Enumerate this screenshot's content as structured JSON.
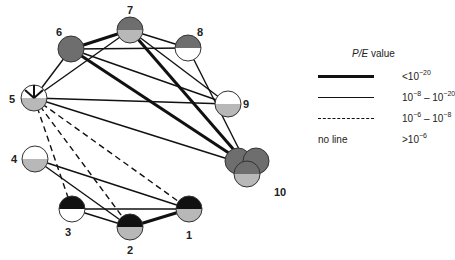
{
  "diagram": {
    "colors": {
      "dark_gray": "#6e6e6e",
      "light_gray": "#b8b8b8",
      "black": "#111111",
      "white": "#ffffff",
      "stroke": "#333333"
    },
    "nodes": [
      {
        "id": "1",
        "label": "1",
        "x": 189,
        "y": 209,
        "top": "black",
        "bottom": "light_gray",
        "label_x": 189,
        "label_y": 239
      },
      {
        "id": "2",
        "label": "2",
        "x": 130,
        "y": 227,
        "top": "black",
        "bottom": "light_gray",
        "label_x": 130,
        "label_y": 254
      },
      {
        "id": "3",
        "label": "3",
        "x": 72,
        "y": 209,
        "top": "black",
        "bottom": "white",
        "label_x": 68,
        "label_y": 236
      },
      {
        "id": "4",
        "label": "4",
        "x": 35,
        "y": 159,
        "top": "white",
        "bottom": "light_gray",
        "label_x": 14,
        "label_y": 163
      },
      {
        "id": "5",
        "label": "5",
        "x": 34,
        "y": 98,
        "top": "white",
        "bottom": "light_gray",
        "label_x": 12,
        "label_y": 103,
        "special": "arrow"
      },
      {
        "id": "6",
        "label": "6",
        "x": 71,
        "y": 49,
        "top": "dark_gray",
        "bottom": "dark_gray",
        "label_x": 59,
        "label_y": 36
      },
      {
        "id": "7",
        "label": "7",
        "x": 130,
        "y": 30,
        "top": "dark_gray",
        "bottom": "light_gray",
        "label_x": 130,
        "label_y": 14
      },
      {
        "id": "8",
        "label": "8",
        "x": 188,
        "y": 48,
        "top": "dark_gray",
        "bottom": "white",
        "label_x": 200,
        "label_y": 36
      },
      {
        "id": "9",
        "label": "9",
        "x": 228,
        "y": 104,
        "top": "white",
        "bottom": "light_gray",
        "label_x": 246,
        "label_y": 108
      },
      {
        "id": "10",
        "label": "10",
        "x": 247,
        "y": 165,
        "cluster": true,
        "label_x": 280,
        "label_y": 196
      }
    ],
    "edges": [
      {
        "from": "6",
        "to": "7",
        "type": "thick"
      },
      {
        "from": "6",
        "to": "10",
        "type": "thick"
      },
      {
        "from": "7",
        "to": "10",
        "type": "thick"
      },
      {
        "from": "2",
        "to": "1",
        "type": "thick"
      },
      {
        "from": "5",
        "to": "6",
        "type": "thin"
      },
      {
        "from": "5",
        "to": "7",
        "type": "thin"
      },
      {
        "from": "6",
        "to": "8",
        "type": "thin"
      },
      {
        "from": "7",
        "to": "8",
        "type": "thin"
      },
      {
        "from": "6",
        "to": "9",
        "type": "thin"
      },
      {
        "from": "7",
        "to": "9",
        "type": "thin"
      },
      {
        "from": "5",
        "to": "9",
        "type": "thin"
      },
      {
        "from": "5",
        "to": "10",
        "type": "thin"
      },
      {
        "from": "8",
        "to": "10",
        "type": "thin"
      },
      {
        "from": "4",
        "to": "1",
        "type": "thin"
      },
      {
        "from": "4",
        "to": "2",
        "type": "thin"
      },
      {
        "from": "3",
        "to": "1",
        "type": "thin"
      },
      {
        "from": "3",
        "to": "2",
        "type": "thin"
      },
      {
        "from": "5",
        "to": "3",
        "type": "dashed"
      },
      {
        "from": "5",
        "to": "2",
        "type": "dashed"
      },
      {
        "from": "5",
        "to": "1",
        "type": "dashed"
      }
    ]
  },
  "legend": {
    "title_italic": "P/E",
    "title_rest": " value",
    "rows": [
      {
        "style": "thick",
        "base": "<10",
        "exp": "−20",
        "tail_base": "",
        "tail_exp": ""
      },
      {
        "style": "thin",
        "base": "10",
        "exp": "−8",
        "sep": " – ",
        "tail_base": "10",
        "tail_exp": "−20"
      },
      {
        "style": "dashed",
        "base": "10",
        "exp": "−6",
        "sep": " – ",
        "tail_base": "10",
        "tail_exp": "−8"
      },
      {
        "style": "none",
        "no_line_label": "no line",
        "base": ">10",
        "exp": "−6",
        "tail_base": "",
        "tail_exp": ""
      }
    ]
  }
}
